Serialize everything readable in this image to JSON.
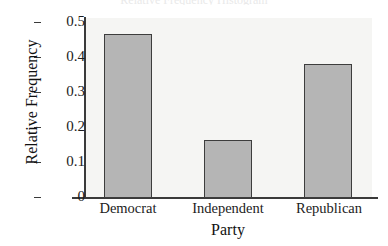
{
  "chart_data": {
    "type": "bar",
    "title": "Relative Frequency Histogram",
    "xlabel": "Party",
    "ylabel": "Relative Frequency",
    "categories": [
      "Democrat",
      "Independent",
      "Republican"
    ],
    "values": [
      0.465,
      0.165,
      0.38
    ],
    "ylim": [
      0,
      0.52
    ],
    "yticks": [
      "0",
      "0.1",
      "0.2",
      "0.3",
      "0.4",
      "0.5"
    ],
    "ytick_values": [
      0,
      0.1,
      0.2,
      0.3,
      0.4,
      0.5
    ],
    "grid": false,
    "legend": "none",
    "bar_color": "#b5b5b5",
    "bar_edge_color": "#3d3d3d",
    "plot_background": "#f5f5f3",
    "axis_color": "#3a3a3a"
  },
  "axes": {
    "y_title": "Relative Frequency",
    "x_title": "Party",
    "ticks": [
      {
        "label": "0.5"
      },
      {
        "label": "0.4"
      },
      {
        "label": "0.3"
      },
      {
        "label": "0.2"
      },
      {
        "label": "0.1"
      },
      {
        "label": "0"
      }
    ]
  },
  "bars": [
    {
      "label": "Democrat",
      "value": "0.465"
    },
    {
      "label": "Independent",
      "value": "0.165"
    },
    {
      "label": "Republican",
      "value": "0.38"
    }
  ],
  "title_clipped": "Relative Frequency Histogram"
}
